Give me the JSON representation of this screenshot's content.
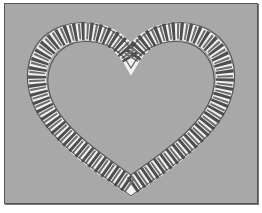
{
  "image": {
    "subject": "heart-shaped woven wreath",
    "colors": {
      "background": "#a8a8a8",
      "border": "#555555",
      "strand": "#6a6a6a",
      "strand_edge": "#3d3d3d",
      "gap": "#f2f2f2"
    }
  }
}
